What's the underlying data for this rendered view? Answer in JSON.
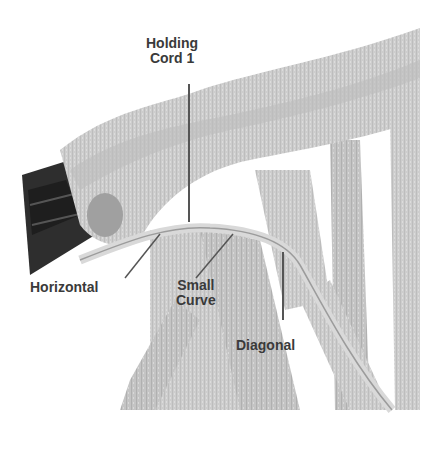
{
  "diagram": {
    "labels": {
      "holding_cord_line1": "Holding",
      "holding_cord_line2": "Cord 1",
      "horizontal": "Horizontal",
      "small_curve_line1": "Small",
      "small_curve_line2": "Curve",
      "diagonal": "Diagonal"
    },
    "colors": {
      "background": "#ffffff",
      "rope": "#cfcfcf",
      "rope_shadow": "#a9a9a9",
      "dowel": "#2e2e2e",
      "label_text": "#3a3a3a",
      "leader_line": "#555555"
    }
  }
}
